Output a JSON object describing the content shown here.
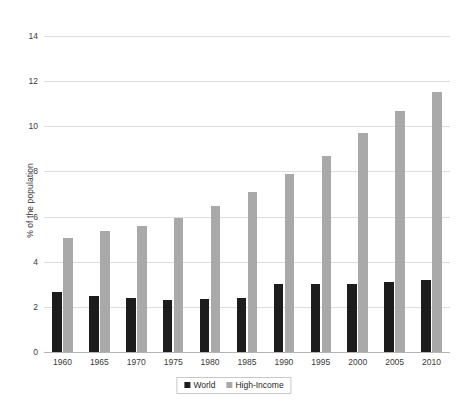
{
  "chart_data": {
    "type": "bar",
    "title": "",
    "xlabel": "",
    "ylabel": "% of the population",
    "ylim": [
      0,
      14
    ],
    "yticks": [
      0,
      2,
      4,
      6,
      8,
      10,
      12,
      14
    ],
    "grid": true,
    "legend_position": "bottom",
    "categories": [
      "1960",
      "1965",
      "1970",
      "1975",
      "1980",
      "1985",
      "1990",
      "1995",
      "2000",
      "2005",
      "2010"
    ],
    "series": [
      {
        "name": "World",
        "color": "#1c1c1c",
        "values": [
          2.65,
          2.5,
          2.4,
          2.3,
          2.35,
          2.4,
          3.0,
          3.0,
          3.0,
          3.1,
          3.2
        ]
      },
      {
        "name": "High-Income",
        "color": "#a9a9a9",
        "values": [
          5.05,
          5.35,
          5.6,
          5.95,
          6.45,
          7.1,
          7.9,
          8.7,
          9.7,
          10.7,
          11.5
        ]
      }
    ]
  },
  "legend": {
    "entries": [
      {
        "label": "World"
      },
      {
        "label": "High-Income"
      }
    ]
  }
}
